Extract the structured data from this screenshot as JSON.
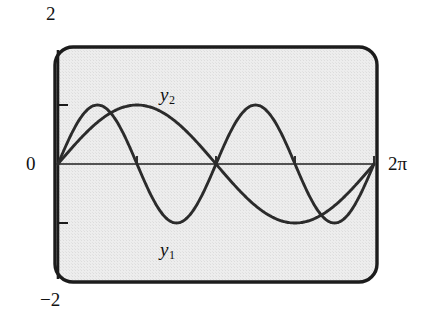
{
  "figure": {
    "frame": {
      "style": "rounded-rectangle",
      "background_color": "#ebebeb",
      "border_color": "#1a1a1a"
    }
  },
  "axes": {
    "y_top_label": "2",
    "y_bottom_label": "−2",
    "y_origin_label": "0",
    "x_end_label": "2π"
  },
  "labels": {
    "curve1": {
      "base": "y",
      "sub": "1"
    },
    "curve2": {
      "base": "y",
      "sub": "2"
    }
  },
  "chart_data": {
    "type": "line",
    "title": "",
    "xlabel": "",
    "ylabel": "",
    "xlim": [
      0,
      6.283185307179586
    ],
    "ylim": [
      -2,
      2
    ],
    "grid": false,
    "legend": "inline-curve-labels",
    "x_tick_labels": [
      "0",
      "2π"
    ],
    "x_tick_values": [
      0,
      6.283185307179586
    ],
    "x_minor_tick_values": [
      1.5707963267948966,
      3.141592653589793,
      4.71238898038469
    ],
    "y_tick_labels": [
      "2",
      "0",
      "−2"
    ],
    "y_tick_values": [
      2,
      0,
      -2
    ],
    "y_minor_tick_values": [
      1,
      -1
    ],
    "series": [
      {
        "name": "y1",
        "expression": "sin(2x)",
        "label": "y_1",
        "color": "#2b2b2b",
        "amplitude": 1,
        "periods_shown": 2,
        "x": [
          0,
          0.3927,
          0.7854,
          1.1781,
          1.5708,
          1.9635,
          2.3562,
          2.7489,
          3.1416,
          3.5343,
          3.927,
          4.3197,
          4.7124,
          5.1051,
          5.4978,
          5.8905,
          6.2832
        ],
        "values": [
          0,
          0.7071,
          1,
          0.7071,
          0,
          -0.7071,
          -1,
          -0.7071,
          0,
          0.7071,
          1,
          0.7071,
          0,
          -0.7071,
          -1,
          -0.7071,
          0
        ]
      },
      {
        "name": "y2",
        "expression": "sin(x)",
        "label": "y_2",
        "color": "#2b2b2b",
        "amplitude": 1,
        "periods_shown": 1,
        "x": [
          0,
          0.3927,
          0.7854,
          1.1781,
          1.5708,
          1.9635,
          2.3562,
          2.7489,
          3.1416,
          3.5343,
          3.927,
          4.3197,
          4.7124,
          5.1051,
          5.4978,
          5.8905,
          6.2832
        ],
        "values": [
          0,
          0.3827,
          0.7071,
          0.9239,
          1,
          0.9239,
          0.7071,
          0.3827,
          0,
          -0.3827,
          -0.7071,
          -0.9239,
          -1,
          -0.9239,
          -0.7071,
          -0.3827,
          0
        ]
      }
    ]
  }
}
